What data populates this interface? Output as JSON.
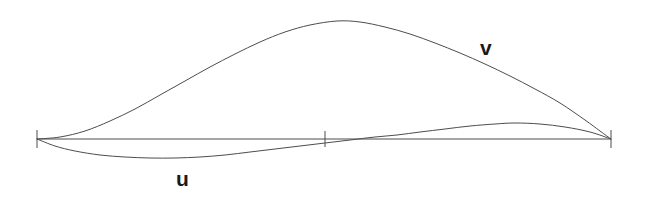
{
  "figure": {
    "width": 646,
    "height": 198,
    "background_color": "#ffffff"
  },
  "labels": {
    "v": "v",
    "u": "u"
  },
  "chart_data": {
    "type": "line",
    "title": "",
    "subtitle": "",
    "xlabel": "",
    "ylabel": "",
    "grid": false,
    "legend_position": "inline-annotation",
    "axis": {
      "x_start_px": 37,
      "x_end_px": 611,
      "baseline_y_px": 139,
      "stroke_color": "#4d4d4d",
      "stroke_width": 1,
      "ticks": [
        {
          "label": "",
          "x_px": 37,
          "top_y_px": 130,
          "bottom_y_px": 148
        },
        {
          "label": "",
          "x_px": 325,
          "top_y_px": 131,
          "bottom_y_px": 147
        },
        {
          "label": "",
          "x_px": 611,
          "top_y_px": 130,
          "bottom_y_px": 148
        }
      ]
    },
    "xlim": [
      37,
      611
    ],
    "ylim_px": [
      18,
      162
    ],
    "series": [
      {
        "name": "v",
        "color": "#4d4d4d",
        "stroke_width": 1,
        "label_position_px": {
          "x": 480,
          "y": 37
        },
        "points_px": [
          {
            "x": 37,
            "y": 139
          },
          {
            "x": 60,
            "y": 137
          },
          {
            "x": 85,
            "y": 131
          },
          {
            "x": 110,
            "y": 121
          },
          {
            "x": 135,
            "y": 109
          },
          {
            "x": 160,
            "y": 95
          },
          {
            "x": 185,
            "y": 81
          },
          {
            "x": 210,
            "y": 67
          },
          {
            "x": 235,
            "y": 54
          },
          {
            "x": 260,
            "y": 42
          },
          {
            "x": 285,
            "y": 32
          },
          {
            "x": 310,
            "y": 25
          },
          {
            "x": 337,
            "y": 21
          },
          {
            "x": 360,
            "y": 22
          },
          {
            "x": 385,
            "y": 27
          },
          {
            "x": 410,
            "y": 34
          },
          {
            "x": 435,
            "y": 43
          },
          {
            "x": 460,
            "y": 53
          },
          {
            "x": 485,
            "y": 64
          },
          {
            "x": 510,
            "y": 76
          },
          {
            "x": 535,
            "y": 89
          },
          {
            "x": 560,
            "y": 103
          },
          {
            "x": 585,
            "y": 120
          },
          {
            "x": 600,
            "y": 131
          },
          {
            "x": 611,
            "y": 139
          }
        ]
      },
      {
        "name": "u",
        "color": "#4d4d4d",
        "stroke_width": 1,
        "label_position_px": {
          "x": 176,
          "y": 168
        },
        "points_px": [
          {
            "x": 37,
            "y": 139
          },
          {
            "x": 55,
            "y": 146
          },
          {
            "x": 75,
            "y": 151
          },
          {
            "x": 100,
            "y": 155
          },
          {
            "x": 125,
            "y": 157
          },
          {
            "x": 150,
            "y": 158
          },
          {
            "x": 175,
            "y": 158
          },
          {
            "x": 200,
            "y": 157
          },
          {
            "x": 225,
            "y": 155
          },
          {
            "x": 250,
            "y": 152
          },
          {
            "x": 275,
            "y": 149
          },
          {
            "x": 300,
            "y": 146
          },
          {
            "x": 325,
            "y": 143
          },
          {
            "x": 350,
            "y": 140
          },
          {
            "x": 375,
            "y": 137
          },
          {
            "x": 397,
            "y": 135
          },
          {
            "x": 420,
            "y": 132
          },
          {
            "x": 445,
            "y": 129
          },
          {
            "x": 470,
            "y": 126
          },
          {
            "x": 495,
            "y": 124
          },
          {
            "x": 515,
            "y": 123
          },
          {
            "x": 540,
            "y": 124
          },
          {
            "x": 565,
            "y": 127
          },
          {
            "x": 590,
            "y": 132
          },
          {
            "x": 611,
            "y": 139
          }
        ]
      }
    ],
    "annotations": [
      {
        "text": "v",
        "x_px": 480,
        "y_px": 37
      },
      {
        "text": "u",
        "x_px": 176,
        "y_px": 168
      }
    ]
  }
}
